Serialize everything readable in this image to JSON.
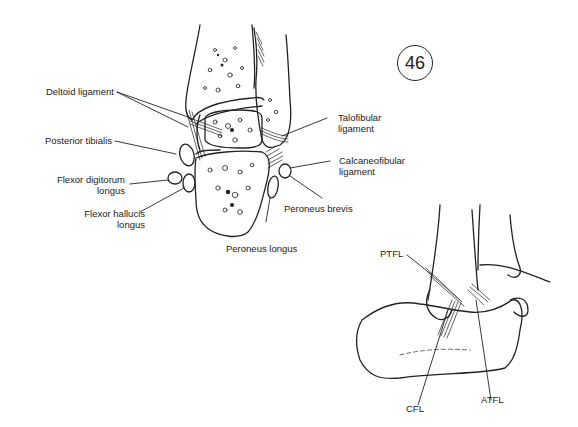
{
  "figure": {
    "number": "46",
    "coronal_section": {
      "labels": {
        "deltoid_ligament": "Deltoid ligament",
        "posterior_tibialis": "Posterior tibialis",
        "flexor_digitorum_longus_1": "Flexor digitorum",
        "flexor_digitorum_longus_2": "longus",
        "flexor_hallucis_longus_1": "Flexor hallucis",
        "flexor_hallucis_longus_2": "longus",
        "talofibular_ligament_1": "Talofibular",
        "talofibular_ligament_2": "ligament",
        "calcaneofibular_ligament_1": "Calcaneofibular",
        "calcaneofibular_ligament_2": "ligament",
        "peroneus_brevis": "Peroneus brevis",
        "peroneus_longus": "Peroneus longus"
      }
    },
    "lateral_view": {
      "labels": {
        "ptfl": "PTFL",
        "cfl": "CFL",
        "atfl": "ATFL"
      }
    }
  }
}
